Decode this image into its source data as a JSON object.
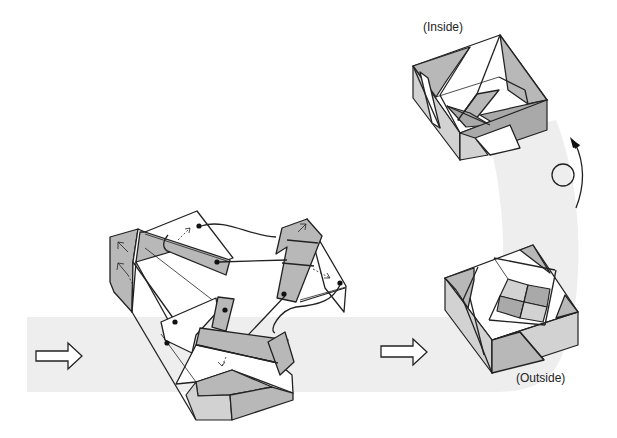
{
  "diagram": {
    "type": "origami-assembly-instructions",
    "labels": {
      "inside": "(Inside)",
      "outside": "(Outside)"
    },
    "steps": [
      {
        "id": "assembly",
        "description": "Three folded units interlocking, with connecting lines and dot markers"
      },
      {
        "id": "result-outside",
        "description": "Finished square box, outside view"
      },
      {
        "id": "result-inside",
        "description": "Finished square box, inside view"
      }
    ],
    "icons": {
      "step-arrow": "hollow-right-arrow",
      "turn-over": "circle-with-curved-arrow"
    },
    "colors": {
      "band": "#eeeeee",
      "paper_colored": "#b8b8b8",
      "paper_light": "#d2d2d2",
      "paper_white": "#ffffff",
      "line": "#222222"
    }
  }
}
